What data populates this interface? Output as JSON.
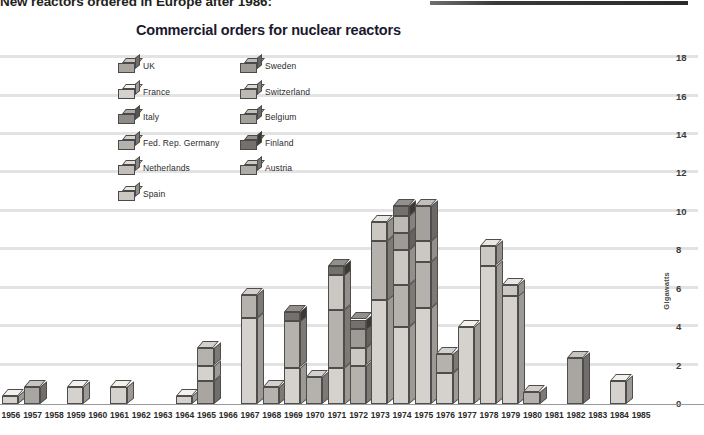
{
  "caption": {
    "text": "New reactors ordered in Europe after 1986:",
    "rule_color": "#2a2a2a"
  },
  "chart_data": {
    "type": "bar",
    "subtype": "stacked-3d-column",
    "title": "Commercial orders for nuclear reactors",
    "xlabel": "",
    "ylabel": "Gigawatts",
    "ylim": [
      0,
      19
    ],
    "yticks": [
      0,
      2,
      4,
      6,
      8,
      10,
      12,
      14,
      16,
      18
    ],
    "grid": true,
    "legend_position": "inside-top-left",
    "categories": [
      "1956",
      "1957",
      "1958",
      "1959",
      "1960",
      "1961",
      "1962",
      "1963",
      "1964",
      "1965",
      "1966",
      "1967",
      "1968",
      "1969",
      "1970",
      "1971",
      "1972",
      "1973",
      "1974",
      "1975",
      "1976",
      "1977",
      "1978",
      "1979",
      "1980",
      "1981",
      "1982",
      "1983",
      "1984",
      "1985"
    ],
    "series": [
      {
        "name": "UK",
        "color": "#a9a6a2",
        "values": [
          0.0,
          0.9,
          0.0,
          0.0,
          0.0,
          0.0,
          0.0,
          0.0,
          0.0,
          1.2,
          0.0,
          0.0,
          0.0,
          0.0,
          0.0,
          0.0,
          0.0,
          0.0,
          0.0,
          0.0,
          0.0,
          0.0,
          0.0,
          0.0,
          0.0,
          0.0,
          2.4,
          0.0,
          0.0,
          0.0
        ]
      },
      {
        "name": "France",
        "color": "#d5d2ce",
        "values": [
          0.4,
          0.0,
          0.0,
          0.9,
          0.0,
          0.9,
          0.0,
          0.0,
          0.4,
          0.8,
          0.0,
          4.5,
          0.0,
          1.9,
          0.0,
          1.9,
          0.0,
          5.4,
          4.0,
          5.0,
          1.6,
          4.0,
          7.2,
          5.6,
          0.0,
          0.0,
          0.0,
          0.0,
          1.2,
          0.0
        ]
      },
      {
        "name": "Italy",
        "color": "#8f8c88",
        "values": [
          0.0,
          0.0,
          0.0,
          0.0,
          0.0,
          0.0,
          0.0,
          0.0,
          0.0,
          0.0,
          0.0,
          0.0,
          0.0,
          0.0,
          0.0,
          0.0,
          0.0,
          0.0,
          0.0,
          0.0,
          0.0,
          0.0,
          0.0,
          0.0,
          0.0,
          0.0,
          0.0,
          0.0,
          0.0,
          0.0
        ]
      },
      {
        "name": "Fed. Rep. Germany",
        "color": "#b5b2ae",
        "values": [
          0.0,
          0.0,
          0.0,
          0.0,
          0.0,
          0.0,
          0.0,
          0.0,
          0.0,
          0.9,
          0.0,
          1.2,
          0.9,
          2.4,
          1.4,
          3.0,
          2.0,
          3.1,
          2.2,
          2.4,
          1.0,
          0.0,
          0.0,
          0.0,
          0.6,
          0.0,
          0.0,
          0.0,
          0.0,
          0.0
        ]
      },
      {
        "name": "Netherlands",
        "color": "#c2bfbb",
        "values": [
          0.0,
          0.0,
          0.0,
          0.0,
          0.0,
          0.0,
          0.0,
          0.0,
          0.0,
          0.0,
          0.0,
          0.0,
          0.0,
          0.0,
          0.0,
          0.0,
          0.0,
          0.0,
          0.0,
          0.0,
          0.0,
          0.0,
          0.0,
          0.0,
          0.0,
          0.0,
          0.0,
          0.0,
          0.0,
          0.0
        ]
      },
      {
        "name": "Spain",
        "color": "#cbc8c4",
        "values": [
          0.0,
          0.0,
          0.0,
          0.0,
          0.0,
          0.0,
          0.0,
          0.0,
          0.0,
          0.0,
          0.0,
          0.0,
          0.0,
          0.0,
          0.0,
          1.8,
          0.9,
          1.0,
          1.8,
          1.1,
          0.0,
          0.0,
          1.0,
          0.6,
          0.0,
          0.0,
          0.0,
          0.0,
          0.0,
          0.0
        ]
      },
      {
        "name": "Sweden",
        "color": "#9e9b97",
        "values": [
          0.0,
          0.0,
          0.0,
          0.0,
          0.0,
          0.0,
          0.0,
          0.0,
          0.0,
          0.0,
          0.0,
          0.0,
          0.0,
          0.0,
          0.0,
          0.0,
          1.0,
          0.0,
          0.9,
          0.0,
          0.0,
          0.0,
          0.0,
          0.0,
          0.0,
          0.0,
          0.0,
          0.0,
          0.0,
          0.0
        ]
      },
      {
        "name": "Switzerland",
        "color": "#bdbab6",
        "values": [
          0.0,
          0.0,
          0.0,
          0.0,
          0.0,
          0.0,
          0.0,
          0.0,
          0.0,
          0.0,
          0.0,
          0.0,
          0.0,
          0.0,
          0.0,
          0.0,
          0.0,
          0.0,
          0.9,
          0.0,
          0.0,
          0.0,
          0.0,
          0.0,
          0.0,
          0.0,
          0.0,
          0.0,
          0.0,
          0.0
        ]
      },
      {
        "name": "Belgium",
        "color": "#a4a19d",
        "values": [
          0.0,
          0.0,
          0.0,
          0.0,
          0.0,
          0.0,
          0.0,
          0.0,
          0.0,
          0.0,
          0.0,
          0.0,
          0.0,
          0.0,
          0.0,
          0.0,
          0.0,
          0.0,
          0.0,
          1.8,
          0.0,
          0.0,
          0.0,
          0.0,
          0.0,
          0.0,
          0.0,
          0.0,
          0.0,
          0.0
        ]
      },
      {
        "name": "Finland",
        "color": "#74716d",
        "values": [
          0.0,
          0.0,
          0.0,
          0.0,
          0.0,
          0.0,
          0.0,
          0.0,
          0.0,
          0.0,
          0.0,
          0.0,
          0.0,
          0.5,
          0.0,
          0.5,
          0.5,
          0.0,
          0.5,
          0.0,
          0.0,
          0.0,
          0.0,
          0.0,
          0.0,
          0.0,
          0.0,
          0.0,
          0.0,
          0.0
        ]
      },
      {
        "name": "Austria",
        "color": "#b0ada9",
        "values": [
          0.0,
          0.0,
          0.0,
          0.0,
          0.0,
          0.0,
          0.0,
          0.0,
          0.0,
          0.0,
          0.0,
          0.0,
          0.0,
          0.0,
          0.0,
          0.0,
          0.0,
          0.0,
          0.0,
          0.0,
          0.0,
          0.0,
          0.0,
          0.0,
          0.0,
          0.0,
          0.0,
          0.0,
          0.0,
          0.0
        ]
      }
    ],
    "totals": [
      0.4,
      0.9,
      0.0,
      0.9,
      0.0,
      0.9,
      0.0,
      0.0,
      0.4,
      2.9,
      0.0,
      5.7,
      0.9,
      4.8,
      1.4,
      7.2,
      4.4,
      9.5,
      10.3,
      10.3,
      2.6,
      4.0,
      8.2,
      6.2,
      0.6,
      0.0,
      2.4,
      0.0,
      1.2,
      0.0
    ]
  },
  "legend": {
    "columns": [
      [
        {
          "label": "UK",
          "color": "#a9a6a2",
          "icon": "cube-swatch"
        },
        {
          "label": "France",
          "color": "#d5d2ce",
          "icon": "cube-swatch"
        },
        {
          "label": "Italy",
          "color": "#8f8c88",
          "icon": "cube-swatch"
        },
        {
          "label": "Fed. Rep. Germany",
          "color": "#b5b2ae",
          "icon": "cube-swatch"
        },
        {
          "label": "Netherlands",
          "color": "#c2bfbb",
          "icon": "cube-swatch"
        },
        {
          "label": "Spain",
          "color": "#cbc8c4",
          "icon": "cube-swatch"
        }
      ],
      [
        {
          "label": "Sweden",
          "color": "#9e9b97",
          "icon": "cube-swatch"
        },
        {
          "label": "Switzerland",
          "color": "#bdbab6",
          "icon": "cube-swatch"
        },
        {
          "label": "Belgium",
          "color": "#a4a19d",
          "icon": "cube-swatch"
        },
        {
          "label": "Finland",
          "color": "#74716d",
          "icon": "cube-swatch"
        },
        {
          "label": "Austria",
          "color": "#b0ada9",
          "icon": "cube-swatch"
        }
      ]
    ]
  }
}
